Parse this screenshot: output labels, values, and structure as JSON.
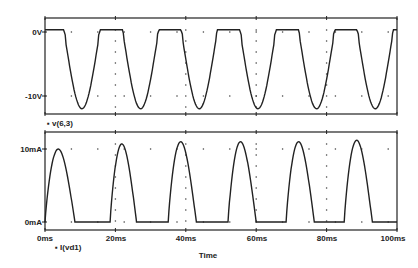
{
  "chart_data": [
    {
      "type": "line",
      "title": "",
      "legend": "v(6,3)",
      "xlabel": "Time",
      "ylabel": "",
      "ytick_labels": [
        "0V",
        "-10V"
      ],
      "yticks": [
        0,
        -10
      ],
      "ylim": [
        -12.5,
        2.2
      ],
      "xlim": [
        0,
        100
      ],
      "grid": "dotted",
      "x": [
        0,
        10.5,
        20,
        27.5,
        37,
        44.5,
        53.5,
        61,
        70,
        77.5,
        86.5,
        94,
        100
      ],
      "values": [
        0.3,
        -12,
        0.3,
        -11.8,
        0.4,
        -11.8,
        0.4,
        -11.8,
        0.4,
        -11.9,
        0.4,
        -11.8,
        0.3
      ]
    },
    {
      "type": "line",
      "title": "",
      "legend": "I(vd1)",
      "xlabel": "Time",
      "ylabel": "",
      "ytick_labels": [
        "10mA",
        "0mA"
      ],
      "yticks": [
        10,
        0
      ],
      "ylim": [
        -1,
        12.3
      ],
      "xlim": [
        0,
        100
      ],
      "grid": "dotted",
      "x": [
        0,
        4,
        8.5,
        18.5,
        22,
        26,
        35,
        39,
        43,
        52,
        55.5,
        60,
        68.5,
        72.5,
        76.5,
        85,
        89,
        93,
        100
      ],
      "values": [
        0,
        10,
        0,
        0,
        10.7,
        0,
        0,
        11,
        0,
        0,
        11,
        0,
        0,
        11,
        0,
        0,
        11.2,
        0,
        0
      ],
      "xtick_labels": [
        "0ms",
        "20ms",
        "40ms",
        "60ms",
        "80ms",
        "100ms"
      ]
    }
  ],
  "top_plot": {
    "y_labels": [
      "0V",
      "-10V"
    ],
    "legend": "▪ v(6,3)"
  },
  "bottom_plot": {
    "y_labels": [
      "10mA",
      "0mA"
    ],
    "legend": "▪ I(vd1)"
  },
  "x_axis": {
    "ticks": [
      "0ms",
      "20ms",
      "40ms",
      "60ms",
      "80ms",
      "100ms"
    ],
    "label": "Time"
  }
}
